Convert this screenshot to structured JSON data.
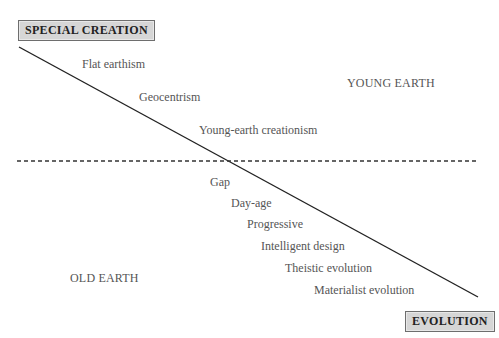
{
  "diagram": {
    "top_box": "SPECIAL CREATION",
    "bottom_box": "EVOLUTION",
    "regions": {
      "upper_right": "YOUNG EARTH",
      "lower_left": "OLD EARTH"
    },
    "young_earth_positions": [
      {
        "label": "Flat earthism"
      },
      {
        "label": "Geocentrism"
      },
      {
        "label": "Young-earth creationism"
      }
    ],
    "old_earth_positions": [
      {
        "label": "Gap"
      },
      {
        "label": "Day-age"
      },
      {
        "label": "Progressive"
      },
      {
        "label": "Intelligent design"
      },
      {
        "label": "Theistic evolution"
      },
      {
        "label": "Materialist evolution"
      }
    ],
    "colors": {
      "box_fill": "#d6d6d6",
      "box_border": "#6e6e6e",
      "line": "#222222",
      "text": "#555555"
    }
  }
}
